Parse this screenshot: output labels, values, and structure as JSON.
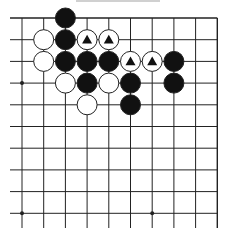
{
  "diagram": {
    "title": "",
    "grid": {
      "x_lines": [
        22,
        43.7,
        65.4,
        87.1,
        108.8,
        130.5,
        152.2,
        173.9,
        195.6,
        217.3
      ],
      "y_lines": [
        18,
        39.7,
        61.4,
        83.1,
        104.8,
        126.5,
        148.2,
        169.9,
        191.6,
        213.3
      ],
      "left_extend_to": 10,
      "bottom_extend_to": 228,
      "top_edge": true,
      "right_edge": true,
      "line_color": "#222222"
    },
    "star_points": [
      {
        "col": 0,
        "row": 3
      },
      {
        "col": 0,
        "row": 9
      },
      {
        "col": 6,
        "row": 9
      }
    ],
    "stone_radius": 10,
    "colors": {
      "black": "#111111",
      "white": "#ffffff",
      "stroke": "#222222",
      "marker": "#111111"
    },
    "stones": [
      {
        "col": 2,
        "row": 0,
        "color": "black",
        "marker": ""
      },
      {
        "col": 1,
        "row": 1,
        "color": "white",
        "marker": ""
      },
      {
        "col": 2,
        "row": 1,
        "color": "black",
        "marker": ""
      },
      {
        "col": 3,
        "row": 1,
        "color": "white",
        "marker": "triangle"
      },
      {
        "col": 4,
        "row": 1,
        "color": "white",
        "marker": "triangle"
      },
      {
        "col": 1,
        "row": 2,
        "color": "white",
        "marker": ""
      },
      {
        "col": 2,
        "row": 2,
        "color": "black",
        "marker": ""
      },
      {
        "col": 3,
        "row": 2,
        "color": "black",
        "marker": ""
      },
      {
        "col": 4,
        "row": 2,
        "color": "black",
        "marker": ""
      },
      {
        "col": 5,
        "row": 2,
        "color": "white",
        "marker": "triangle"
      },
      {
        "col": 6,
        "row": 2,
        "color": "white",
        "marker": "triangle"
      },
      {
        "col": 7,
        "row": 2,
        "color": "black",
        "marker": ""
      },
      {
        "col": 2,
        "row": 3,
        "color": "white",
        "marker": ""
      },
      {
        "col": 3,
        "row": 3,
        "color": "black",
        "marker": ""
      },
      {
        "col": 4,
        "row": 3,
        "color": "white",
        "marker": ""
      },
      {
        "col": 5,
        "row": 3,
        "color": "black",
        "marker": ""
      },
      {
        "col": 7,
        "row": 3,
        "color": "black",
        "marker": ""
      },
      {
        "col": 3,
        "row": 4,
        "color": "white",
        "marker": ""
      },
      {
        "col": 5,
        "row": 4,
        "color": "black",
        "marker": ""
      }
    ]
  }
}
